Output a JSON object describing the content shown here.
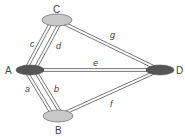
{
  "diagram": {
    "type": "graph",
    "nodes": [
      {
        "id": "A",
        "label": "A",
        "x": 30,
        "y": 70,
        "rx": 14,
        "ry": 5,
        "fill": "#555555",
        "label_x": 5,
        "label_y": 74
      },
      {
        "id": "B",
        "label": "B",
        "x": 58,
        "y": 116,
        "rx": 15,
        "ry": 6,
        "fill": "#c8c8c8",
        "label_x": 55,
        "label_y": 134
      },
      {
        "id": "C",
        "label": "C",
        "x": 57,
        "y": 20,
        "rx": 15,
        "ry": 6,
        "fill": "#c8c8c8",
        "label_x": 53,
        "label_y": 13
      },
      {
        "id": "D",
        "label": "D",
        "x": 160,
        "y": 70,
        "rx": 14,
        "ry": 5,
        "fill": "#555555",
        "label_x": 176,
        "label_y": 74
      }
    ],
    "edges": [
      {
        "id": "a",
        "label": "a",
        "from": "A",
        "to": "B",
        "offset": -4,
        "label_x": 25,
        "label_y": 92
      },
      {
        "id": "b",
        "label": "b",
        "from": "A",
        "to": "B",
        "offset": 4,
        "label_x": 54,
        "label_y": 92
      },
      {
        "id": "c",
        "label": "c",
        "from": "A",
        "to": "C",
        "offset": -4,
        "label_x": 30,
        "label_y": 47
      },
      {
        "id": "d",
        "label": "d",
        "from": "A",
        "to": "C",
        "offset": 4,
        "label_x": 56,
        "label_y": 49
      },
      {
        "id": "e",
        "label": "e",
        "from": "A",
        "to": "D",
        "offset": 0,
        "label_x": 93,
        "label_y": 66
      },
      {
        "id": "f",
        "label": "f",
        "from": "B",
        "to": "D",
        "offset": 0,
        "label_x": 110,
        "label_y": 107
      },
      {
        "id": "g",
        "label": "g",
        "from": "C",
        "to": "D",
        "offset": 0,
        "label_x": 110,
        "label_y": 38
      }
    ],
    "colors": {
      "edge_stroke": "#555555",
      "label": "#444444",
      "background": "#ffffff"
    }
  }
}
